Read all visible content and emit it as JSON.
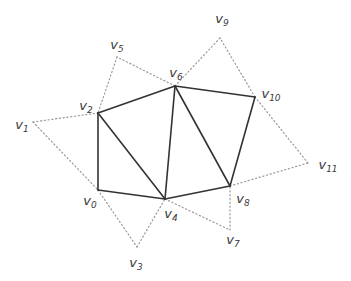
{
  "diagram": {
    "title": "",
    "colors": {
      "solid_edge": "#333333",
      "dotted_edge": "#9a9a9a",
      "label": "#3a3a3a",
      "background": "#ffffff"
    },
    "vertices": [
      {
        "id": "v0",
        "base": "v",
        "sub": "0",
        "x": 98,
        "y": 190,
        "lx": 90,
        "ly": 202
      },
      {
        "id": "v1",
        "base": "v",
        "sub": "1",
        "x": 33,
        "y": 122,
        "lx": 22,
        "ly": 126
      },
      {
        "id": "v2",
        "base": "v",
        "sub": "2",
        "x": 98,
        "y": 113,
        "lx": 86,
        "ly": 107
      },
      {
        "id": "v3",
        "base": "v",
        "sub": "3",
        "x": 137,
        "y": 247,
        "lx": 136,
        "ly": 264
      },
      {
        "id": "v4",
        "base": "v",
        "sub": "4",
        "x": 165,
        "y": 199,
        "lx": 171,
        "ly": 215
      },
      {
        "id": "v5",
        "base": "v",
        "sub": "5",
        "x": 117,
        "y": 57,
        "lx": 117,
        "ly": 46
      },
      {
        "id": "v6",
        "base": "v",
        "sub": "6",
        "x": 175,
        "y": 86,
        "lx": 176,
        "ly": 74
      },
      {
        "id": "v7",
        "base": "v",
        "sub": "7",
        "x": 230,
        "y": 230,
        "lx": 233,
        "ly": 241
      },
      {
        "id": "v8",
        "base": "v",
        "sub": "8",
        "x": 230,
        "y": 186,
        "lx": 243,
        "ly": 200
      },
      {
        "id": "v9",
        "base": "v",
        "sub": "9",
        "x": 220,
        "y": 38,
        "lx": 222,
        "ly": 20
      },
      {
        "id": "v10",
        "base": "v",
        "sub": "10",
        "x": 255,
        "y": 97,
        "lx": 271,
        "ly": 95
      },
      {
        "id": "v11",
        "base": "v",
        "sub": "11",
        "x": 308,
        "y": 163,
        "lx": 328,
        "ly": 166
      }
    ],
    "solid_edges": [
      [
        "v2",
        "v6"
      ],
      [
        "v6",
        "v10"
      ],
      [
        "v10",
        "v8"
      ],
      [
        "v8",
        "v4"
      ],
      [
        "v4",
        "v0"
      ],
      [
        "v0",
        "v2"
      ],
      [
        "v2",
        "v4"
      ],
      [
        "v4",
        "v6"
      ],
      [
        "v6",
        "v8"
      ]
    ],
    "dotted_edges": [
      [
        "v1",
        "v2"
      ],
      [
        "v1",
        "v0"
      ],
      [
        "v0",
        "v3"
      ],
      [
        "v3",
        "v4"
      ],
      [
        "v4",
        "v7"
      ],
      [
        "v7",
        "v8"
      ],
      [
        "v8",
        "v11"
      ],
      [
        "v11",
        "v10"
      ],
      [
        "v10",
        "v9"
      ],
      [
        "v9",
        "v6"
      ],
      [
        "v6",
        "v5"
      ],
      [
        "v5",
        "v2"
      ]
    ]
  }
}
